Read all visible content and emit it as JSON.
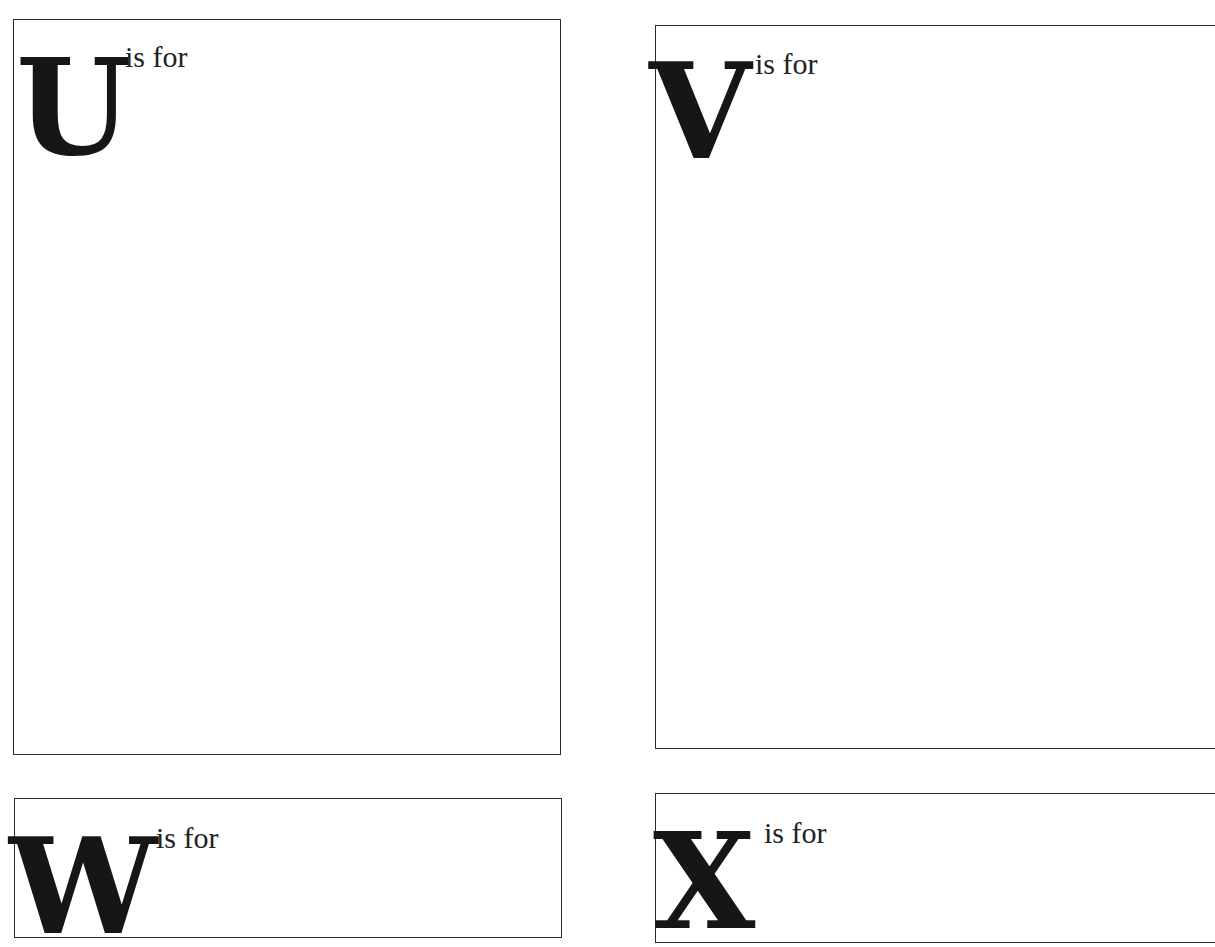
{
  "page": {
    "background": "#ffffff",
    "border_color": "#2b2b2b",
    "text_color": "#1a1a1a"
  },
  "cards": [
    {
      "letter": "U",
      "caption": "is for"
    },
    {
      "letter": "V",
      "caption": "is for"
    },
    {
      "letter": "W",
      "caption": "is for"
    },
    {
      "letter": "X",
      "caption": "is for"
    }
  ]
}
